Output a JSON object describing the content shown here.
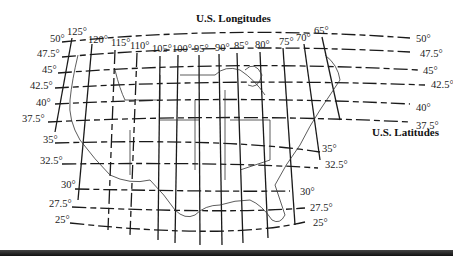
{
  "titles": {
    "longitudes": "U.S. Longitudes",
    "latitudes": "U.S. Latitudes"
  },
  "longitude_labels": [
    {
      "label": "125°",
      "x": 72,
      "y": 35
    },
    {
      "label": "120°",
      "x": 91,
      "y": 43
    },
    {
      "label": "115°",
      "x": 117,
      "y": 47
    },
    {
      "label": "110°",
      "x": 138,
      "y": 50
    },
    {
      "label": "105°",
      "x": 156,
      "y": 53
    },
    {
      "label": "100°",
      "x": 180,
      "y": 52
    },
    {
      "label": "95°",
      "x": 199,
      "y": 52
    },
    {
      "label": "90°",
      "x": 219,
      "y": 51
    },
    {
      "label": "85°",
      "x": 237,
      "y": 50
    },
    {
      "label": "80°",
      "x": 258,
      "y": 49
    },
    {
      "label": "75°",
      "x": 281,
      "y": 45
    },
    {
      "label": "70°",
      "x": 303,
      "y": 41
    },
    {
      "label": "65°",
      "x": 321,
      "y": 34
    }
  ],
  "latitude_labels_left": [
    {
      "label": "50°",
      "x": 51,
      "y": 42
    },
    {
      "label": "47.5°",
      "x": 37,
      "y": 57
    },
    {
      "label": "45°",
      "x": 43,
      "y": 73
    },
    {
      "label": "42.5°",
      "x": 31,
      "y": 89
    },
    {
      "label": "40°",
      "x": 36,
      "y": 106
    },
    {
      "label": "37.5°",
      "x": 24,
      "y": 122
    },
    {
      "label": "35°",
      "x": 43,
      "y": 143
    },
    {
      "label": "32.5°",
      "x": 40,
      "y": 164
    },
    {
      "label": "30°",
      "x": 61,
      "y": 188
    },
    {
      "label": "27.5°",
      "x": 49,
      "y": 207
    },
    {
      "label": "25°",
      "x": 55,
      "y": 223
    }
  ],
  "latitude_labels_right": [
    {
      "label": "50°",
      "x": 417,
      "y": 42
    },
    {
      "label": "47.5°",
      "x": 420,
      "y": 57
    },
    {
      "label": "45°",
      "x": 423,
      "y": 74
    },
    {
      "label": "42.5°",
      "x": 430,
      "y": 88
    },
    {
      "label": "40°",
      "x": 417,
      "y": 111
    },
    {
      "label": "37.5°",
      "x": 417,
      "y": 129
    },
    {
      "label": "35°",
      "x": 322,
      "y": 152
    },
    {
      "label": "32.5°",
      "x": 325,
      "y": 168
    },
    {
      "label": "30°",
      "x": 300,
      "y": 195
    },
    {
      "label": "27.5°",
      "x": 310,
      "y": 211
    },
    {
      "label": "25°",
      "x": 313,
      "y": 226
    }
  ],
  "colors": {
    "line": "#1a1a1a",
    "text": "#222222",
    "background": "#ffffff",
    "bottom_bar": "#222222"
  }
}
